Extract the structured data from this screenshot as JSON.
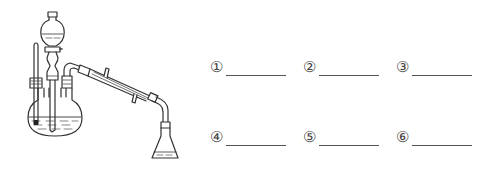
{
  "diagram": {
    "type": "distillation-apparatus",
    "components": [
      "thermometer",
      "separatory-funnel",
      "three-neck-round-bottom-flask",
      "distillation-adapter",
      "liebig-condenser",
      "receiving-adapter",
      "erlenmeyer-flask"
    ]
  },
  "blanks": [
    {
      "label": "①",
      "answer": ""
    },
    {
      "label": "②",
      "answer": ""
    },
    {
      "label": "③",
      "answer": ""
    },
    {
      "label": "④",
      "answer": ""
    },
    {
      "label": "⑤",
      "answer": ""
    },
    {
      "label": "⑥",
      "answer": ""
    }
  ]
}
